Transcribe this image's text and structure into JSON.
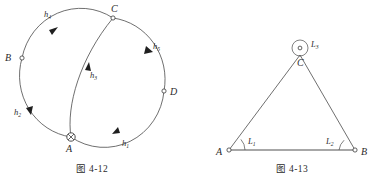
{
  "figures": [
    {
      "id": "fig-4-12",
      "caption": "图 4-12",
      "type": "leveling-network-circular",
      "points": [
        {
          "id": "A",
          "label": "A",
          "marker": "benchmark-cross-circle"
        },
        {
          "id": "B",
          "label": "B",
          "marker": "open-circle"
        },
        {
          "id": "C",
          "label": "C",
          "marker": "open-circle"
        },
        {
          "id": "D",
          "label": "D",
          "marker": "open-circle"
        }
      ],
      "routes": [
        {
          "id": "h1",
          "base": "h",
          "subscript": "1",
          "from": "A",
          "to": "D",
          "arrow": "forward"
        },
        {
          "id": "h2",
          "base": "h",
          "subscript": "2",
          "from": "A",
          "to": "B",
          "arrow": "forward"
        },
        {
          "id": "h3",
          "base": "h",
          "subscript": "3",
          "from": "A",
          "to": "C",
          "arrow": "forward"
        },
        {
          "id": "h4",
          "base": "h",
          "subscript": "4",
          "from": "B",
          "to": "C",
          "arrow": "forward"
        },
        {
          "id": "h5",
          "base": "h",
          "subscript": "5",
          "from": "C",
          "to": "D",
          "arrow": "forward"
        }
      ]
    },
    {
      "id": "fig-4-13",
      "caption": "图 4-13",
      "type": "triangle-angle-network",
      "points": [
        {
          "id": "A",
          "label": "A",
          "marker": "open-circle"
        },
        {
          "id": "B",
          "label": "B",
          "marker": "open-circle"
        },
        {
          "id": "C",
          "label": "C",
          "marker": "open-circle"
        }
      ],
      "angles": [
        {
          "id": "L1",
          "base": "L",
          "subscript": "1",
          "at": "A",
          "arc": "minor"
        },
        {
          "id": "L2",
          "base": "L",
          "subscript": "2",
          "at": "B",
          "arc": "minor"
        },
        {
          "id": "L3",
          "base": "L",
          "subscript": "3",
          "at": "C",
          "arc": "reflex-full"
        }
      ]
    }
  ],
  "colors": {
    "stroke": "#4a4a4a",
    "base_line": "#8a8a8a",
    "text": "#2b2b2b",
    "background": "#ffffff"
  }
}
